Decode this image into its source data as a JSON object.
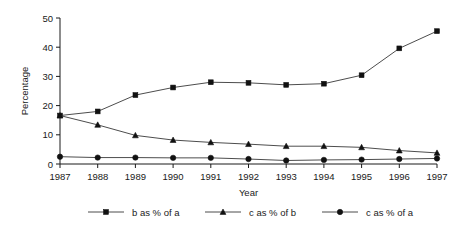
{
  "chart_data": {
    "type": "line",
    "title": "",
    "xlabel": "Year",
    "ylabel": "Percentage",
    "categories": [
      "1987",
      "1988",
      "1989",
      "1990",
      "1991",
      "1992",
      "1993",
      "1994",
      "1995",
      "1996",
      "1997"
    ],
    "x": [
      1987,
      1988,
      1989,
      1990,
      1991,
      1992,
      1993,
      1994,
      1995,
      1996,
      1997
    ],
    "xlim": [
      1987,
      1997
    ],
    "ylim": [
      0,
      50
    ],
    "yticks": [
      0,
      10,
      20,
      30,
      40,
      50
    ],
    "ytick_labels": [
      "0",
      "10",
      "20",
      "30",
      "40",
      "50"
    ],
    "grid": false,
    "legend_position": "bottom",
    "series": [
      {
        "name": "b as % of a",
        "marker": "square",
        "color": "#111111",
        "values": [
          16.6,
          18.0,
          23.6,
          26.2,
          28.0,
          27.8,
          27.1,
          27.5,
          30.4,
          39.6,
          45.5
        ]
      },
      {
        "name": "c as % of b",
        "marker": "triangle",
        "color": "#111111",
        "values": [
          16.6,
          13.4,
          9.8,
          8.2,
          7.4,
          6.8,
          6.1,
          6.1,
          5.7,
          4.6,
          3.8
        ]
      },
      {
        "name": "c as % of a",
        "marker": "circle",
        "color": "#111111",
        "values": [
          2.5,
          2.2,
          2.2,
          2.1,
          2.1,
          1.7,
          1.2,
          1.4,
          1.5,
          1.7,
          1.9
        ]
      }
    ]
  },
  "legend": {
    "entries": [
      {
        "label": "b as % of a",
        "marker": "square"
      },
      {
        "label": "c as % of b",
        "marker": "triangle"
      },
      {
        "label": "c as % of a",
        "marker": "circle"
      }
    ]
  },
  "axes": {
    "y_title": "Percentage",
    "x_title": "Year"
  }
}
